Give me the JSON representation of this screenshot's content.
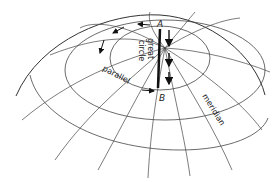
{
  "diagram": {
    "labels": {
      "point_a": "A",
      "point_b": "B",
      "great_circle": "great circle",
      "great_circle_line1": "great",
      "great_circle_line2": "circle",
      "parallel": "parallel",
      "meridian": "meridian"
    },
    "colors": {
      "line": "#333333",
      "heavy": "#111111",
      "background": "#ffffff"
    }
  }
}
